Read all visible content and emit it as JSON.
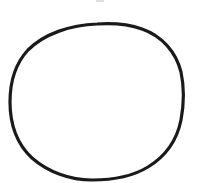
{
  "drawing": {
    "shape": "hand-drawn circle",
    "stroke_color": "#1a1a1a",
    "fill_color": "#ffffff",
    "background_color": "#ffffff",
    "stroke_width": 3.2,
    "path": "M 97 24 C 112 23, 128 24, 142 29 C 162 36, 176 52, 181 72 C 184 86, 184 104, 181 120 C 177 140, 166 156, 148 167 C 130 178, 110 180, 92 180 C 70 180, 48 172, 32 158 C 17 144, 10 124, 10 102 C 10 82, 15 64, 28 50 C 44 34, 70 25, 97 24 Z"
  },
  "top_mark": {
    "color": "#c8c8c8"
  }
}
